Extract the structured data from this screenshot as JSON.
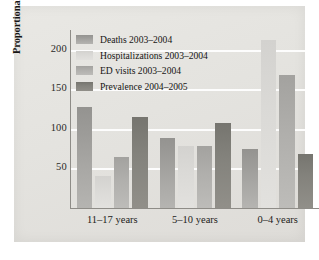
{
  "chart_data": {
    "type": "bar",
    "title": "",
    "xlabel": "",
    "ylabel": "Proportional impact (percent of total)",
    "ylim": [
      0,
      225
    ],
    "yticks": [
      50,
      100,
      150,
      200
    ],
    "ytick_labels": [
      "50",
      "100",
      "150",
      "200"
    ],
    "grid": true,
    "legend_position": "top-left",
    "categories": [
      "11–17 years",
      "5–10 years",
      "0–4 years"
    ],
    "series": [
      {
        "name": "Deaths 2003–2004",
        "color": "#9d9c99",
        "values": [
          128,
          88,
          75
        ]
      },
      {
        "name": "Hospitalizations 2003–2004",
        "color": "#dad9d6",
        "values": [
          40,
          78,
          213
        ]
      },
      {
        "name": "ED visits 2003–2004",
        "color": "#b0afac",
        "values": [
          65,
          78,
          168
        ]
      },
      {
        "name": "Prevalence 2004–2005",
        "color": "#83827c",
        "values": [
          115,
          107,
          68
        ]
      }
    ]
  },
  "axis": {
    "y_label": "Proportional impact (percent of total)",
    "ticks": [
      {
        "label": "200",
        "value": 200
      },
      {
        "label": "150",
        "value": 150
      },
      {
        "label": "100",
        "value": 100
      },
      {
        "label": "50",
        "value": 50
      }
    ]
  },
  "legend": {
    "items": [
      {
        "label": "Deaths 2003–2004",
        "color": "#9d9c99"
      },
      {
        "label": "Hospitalizations 2003–2004",
        "color": "#dad9d6"
      },
      {
        "label": "ED visits 2003–2004",
        "color": "#b0afac"
      },
      {
        "label": "Prevalence 2004–2005",
        "color": "#83827c"
      }
    ]
  },
  "groups": [
    {
      "label": "11–17 years"
    },
    {
      "label": "5–10 years"
    },
    {
      "label": "0–4 years"
    }
  ]
}
